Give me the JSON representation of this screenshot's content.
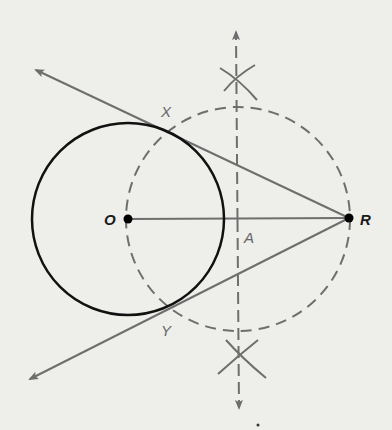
{
  "diagram": {
    "background": "#eeeeeb",
    "colors": {
      "circle": "#111111",
      "construction": "#6e6e6e",
      "points": "#000000"
    },
    "points": {
      "O": {
        "label": "O",
        "x": 128,
        "y": 219
      },
      "R": {
        "label": "R",
        "x": 349,
        "y": 218
      },
      "A": {
        "label": "A",
        "x": 238,
        "y": 219
      },
      "X": {
        "label": "X",
        "x": 170,
        "y": 124
      },
      "Y": {
        "label": "Y",
        "x": 172,
        "y": 313
      }
    },
    "circles": [
      {
        "name": "circle-O",
        "cx": 128,
        "cy": 219,
        "r": 96,
        "style": "solid"
      },
      {
        "name": "circle-A",
        "cx": 238,
        "cy": 219,
        "r": 112,
        "style": "dashed"
      }
    ],
    "segments": [
      {
        "name": "segment-OR",
        "from": "O",
        "to": "R"
      }
    ],
    "rays": [
      {
        "name": "tangent-RX",
        "from": "R",
        "to": [
          34,
          69
        ]
      },
      {
        "name": "tangent-RY",
        "from": "R",
        "to": [
          28,
          380
        ]
      },
      {
        "name": "perpendicular-bisector",
        "from": [
          239,
          410
        ],
        "to": [
          236,
          30
        ],
        "style": "dashed",
        "bidirectional": true
      }
    ],
    "arc_marks": [
      {
        "name": "arc-mark-top",
        "x": 236,
        "y": 78
      },
      {
        "name": "arc-mark-bottom",
        "x": 239,
        "y": 360
      }
    ]
  }
}
